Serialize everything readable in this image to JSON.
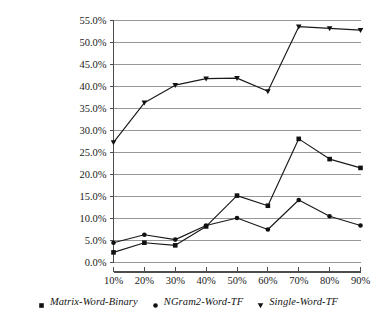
{
  "chart_data": {
    "type": "line",
    "title": "",
    "subtitle": "",
    "xlabel": "",
    "ylabel": "",
    "x": [
      "10%",
      "20%",
      "30%",
      "40%",
      "50%",
      "60%",
      "70%",
      "80%",
      "90%"
    ],
    "categories": [
      "10%",
      "20%",
      "30%",
      "40%",
      "50%",
      "60%",
      "70%",
      "80%",
      "90%"
    ],
    "xtick_labels": [
      "10%",
      "20%",
      "30%",
      "40%",
      "50%",
      "60%",
      "70%",
      "80%",
      "90%"
    ],
    "ytick_labels": [
      "0.0%",
      "5.0%",
      "10.0%",
      "15.0%",
      "20.0%",
      "25.0%",
      "30.0%",
      "35.0%",
      "40.0%",
      "45.0%",
      "50.0%",
      "55.0%"
    ],
    "ytick_values": [
      0,
      5,
      10,
      15,
      20,
      25,
      30,
      35,
      40,
      45,
      50,
      55
    ],
    "ylim": [
      0,
      55
    ],
    "grid": "horizontal",
    "legend_position": "bottom",
    "series": [
      {
        "name": "Single-Word-TF",
        "marker": "triangle-down",
        "values": [
          27.3,
          36.3,
          40.3,
          41.8,
          41.9,
          38.9,
          53.6,
          53.2,
          52.8
        ]
      },
      {
        "name": "Matrix-Word-Binary",
        "marker": "square",
        "values": [
          2.3,
          4.5,
          3.9,
          8.2,
          15.2,
          12.9,
          28.1,
          23.5,
          21.5
        ]
      },
      {
        "name": "NGram2-Word-TF",
        "marker": "circle",
        "values": [
          4.5,
          6.3,
          5.2,
          8.4,
          10.1,
          7.5,
          14.2,
          10.5,
          8.4
        ]
      }
    ]
  },
  "legend": {
    "items": [
      {
        "label": "Matrix-Word-Binary",
        "marker": "square"
      },
      {
        "label": "NGram2-Word-TF",
        "marker": "circle"
      },
      {
        "label": "Single-Word-TF",
        "marker": "triangle-down"
      }
    ]
  },
  "colors": {
    "line": "#1a1a1a",
    "marker": "#111111",
    "grid": "#8c8c8c",
    "axis": "#4d4d4d",
    "background": "#ffffff",
    "text": "#141414"
  }
}
